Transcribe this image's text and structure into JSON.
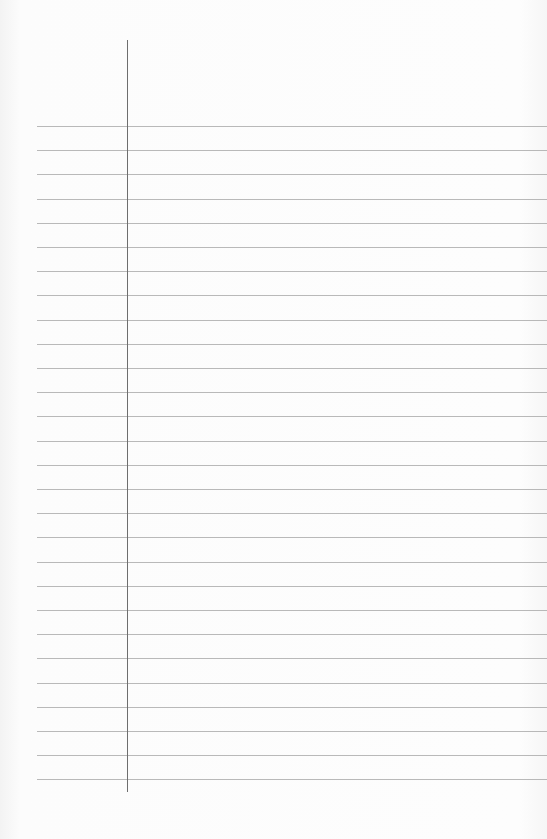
{
  "page": {
    "type": "lined-paper",
    "background_color": "#fbfbfb",
    "rule_color": "#a8a8a8",
    "margin_line_color": "#6e6e6e",
    "rule_count": 28,
    "first_rule_y": 126,
    "rule_spacing": 24.2,
    "margin_line_x": 127
  }
}
